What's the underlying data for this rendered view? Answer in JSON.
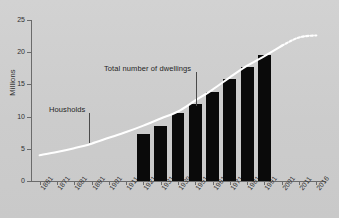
{
  "chart_data": {
    "type": "bar",
    "title": "",
    "xlabel": "",
    "ylabel": "Millions",
    "ylim": [
      0,
      25
    ],
    "yticks": [
      0,
      5,
      10,
      15,
      20,
      25
    ],
    "grid": false,
    "legend_position": "none",
    "categories": [
      "1861",
      "1871",
      "1881",
      "1891",
      "1901",
      "1911",
      "1921",
      "1931",
      "1939",
      "1951",
      "1961",
      "1971",
      "1981",
      "1991",
      "2001",
      "2011",
      "2016"
    ],
    "series": [
      {
        "name": "Total number of dwellings",
        "type": "bar",
        "color": "#0a0a0a",
        "values": [
          null,
          null,
          null,
          null,
          null,
          null,
          7.3,
          8.6,
          10.6,
          11.9,
          13.8,
          15.9,
          17.7,
          19.6,
          null,
          null,
          null
        ]
      },
      {
        "name": "Housholds",
        "type": "line",
        "color": "#ffffff",
        "values": [
          4.0,
          4.5,
          5.1,
          5.8,
          6.7,
          7.6,
          8.6,
          9.7,
          10.8,
          12.5,
          14.2,
          16.1,
          17.9,
          19.4,
          21.0,
          22.3,
          22.6
        ],
        "dashed_from": "2001"
      }
    ],
    "annotations": [
      {
        "text": "Total number of dwellings",
        "target_category": "1951"
      },
      {
        "text": "Housholds",
        "target_category": "1891"
      }
    ]
  },
  "axis": {
    "y_title": "Millions",
    "y_ticks": [
      "0",
      "5",
      "10",
      "15",
      "20",
      "25"
    ],
    "x_ticks": [
      "1861",
      "1871",
      "1881",
      "1891",
      "1901",
      "1911",
      "1921",
      "1931",
      "1939",
      "1951",
      "1961",
      "1971",
      "1981",
      "1991",
      "2001",
      "2011",
      "2016"
    ]
  },
  "annotations": {
    "dwellings_label": "Total number of dwellings",
    "households_label": "Housholds"
  },
  "colors": {
    "background": "#cfcfcf",
    "bar": "#0a0a0a",
    "line": "#ffffff",
    "axis": "#6b6b6b",
    "text": "#2b2b2b"
  }
}
